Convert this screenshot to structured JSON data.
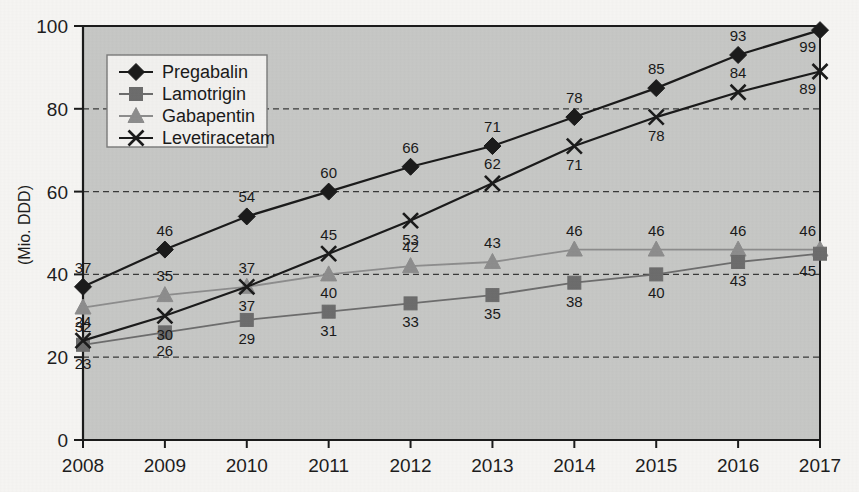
{
  "chart_data": {
    "type": "line",
    "title": "",
    "xlabel": "",
    "ylabel": "(Mio. DDD)",
    "categories": [
      "2008",
      "2009",
      "2010",
      "2011",
      "2012",
      "2013",
      "2014",
      "2015",
      "2016",
      "2017"
    ],
    "x": [
      2008,
      2009,
      2010,
      2011,
      2012,
      2013,
      2014,
      2015,
      2016,
      2017
    ],
    "xlim": [
      2008,
      2017
    ],
    "ylim": [
      0,
      100
    ],
    "yticks": [
      0,
      20,
      40,
      60,
      80,
      100
    ],
    "ytick_labels": [
      "0",
      "20",
      "40",
      "60",
      "80",
      "100"
    ],
    "grid": "horizontal-dashed",
    "legend_position": "top-left-inside",
    "series": [
      {
        "name": "Pregabalin",
        "marker": "diamond",
        "color": "#1b1b1b",
        "values": [
          37,
          46,
          54,
          60,
          66,
          71,
          78,
          85,
          93,
          99
        ],
        "label_positions": [
          "above",
          "above",
          "above",
          "above",
          "above",
          "above",
          "above",
          "above",
          "above",
          "below-right"
        ]
      },
      {
        "name": "Lamotrigin",
        "marker": "square",
        "color": "#6d6d6d",
        "values": [
          23,
          26,
          29,
          31,
          33,
          35,
          38,
          40,
          43,
          45
        ],
        "label_positions": [
          "below",
          "below",
          "below",
          "below",
          "below",
          "below",
          "below",
          "below",
          "below",
          "below-right"
        ]
      },
      {
        "name": "Gabapentin",
        "marker": "triangle",
        "color": "#8d8d8d",
        "values": [
          32,
          35,
          37,
          40,
          42,
          43,
          46,
          46,
          46,
          46
        ],
        "label_positions": [
          "below",
          "above",
          "above",
          "below",
          "above",
          "above",
          "above",
          "above",
          "above",
          "above-right"
        ]
      },
      {
        "name": "Levetiracetam",
        "marker": "x",
        "color": "#1b1b1b",
        "values": [
          24,
          30,
          37,
          45,
          53,
          62,
          71,
          78,
          84,
          89
        ],
        "label_positions": [
          "above",
          "below",
          "below",
          "above",
          "below",
          "above",
          "below",
          "below",
          "above",
          "below-right"
        ]
      }
    ]
  },
  "colors": {
    "plot_background": "#c7c8c6",
    "page_background": "#f6f5f3",
    "axis": "#1b1b1b",
    "gridline": "#3a3a3a",
    "legend_background": "#f2f1ef",
    "legend_border": "#7a7a7a",
    "pregabalin": "#1b1b1b",
    "lamotrigin": "#6d6d6d",
    "gabapentin": "#8d8d8d",
    "levetiracetam": "#1b1b1b"
  },
  "legend": {
    "items": [
      {
        "label": "Pregabalin",
        "marker": "diamond-marker-icon"
      },
      {
        "label": "Lamotrigin",
        "marker": "square-marker-icon"
      },
      {
        "label": "Gabapentin",
        "marker": "triangle-marker-icon"
      },
      {
        "label": "Levetiracetam",
        "marker": "x-marker-icon"
      }
    ]
  }
}
